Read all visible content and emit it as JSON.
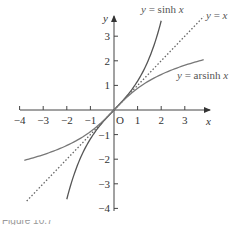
{
  "chart_data": {
    "type": "line",
    "title": "",
    "xlabel": "x",
    "ylabel": "y",
    "origin_label": "O",
    "xlim": [
      -4,
      4
    ],
    "ylim": [
      -4,
      3.8
    ],
    "grid": false,
    "legend": "inline labels",
    "x_ticks": [
      -4,
      -3,
      -2,
      -1,
      1,
      2,
      3
    ],
    "y_ticks": [
      3,
      2,
      1,
      -1,
      -2,
      -3,
      -4
    ],
    "x_tick_labels": [
      "−4",
      "−3",
      "−2",
      "−1",
      "1",
      "2",
      "3"
    ],
    "y_tick_labels": [
      "3",
      "2",
      "1",
      "−1",
      "−2",
      "−3",
      "−4"
    ],
    "series": [
      {
        "name": "y = sinh x",
        "style": "solid",
        "color": "#555555",
        "x": [
          -2.0,
          -1.5,
          -1.0,
          -0.5,
          0,
          0.5,
          1.0,
          1.5,
          2.0
        ],
        "y": [
          -3.63,
          -2.13,
          -1.18,
          -0.52,
          0,
          0.52,
          1.18,
          2.13,
          3.63
        ]
      },
      {
        "name": "y = x",
        "style": "dotted",
        "color": "#666666",
        "x": [
          -3.7,
          3.8
        ],
        "y": [
          -3.7,
          3.8
        ]
      },
      {
        "name": "y = arsinh x",
        "style": "solid",
        "color": "#777777",
        "x": [
          -3.8,
          -3,
          -2,
          -1,
          0,
          1,
          2,
          3,
          3.8
        ],
        "y": [
          -2.04,
          -1.82,
          -1.44,
          -0.88,
          0,
          0.88,
          1.44,
          1.82,
          2.04
        ]
      }
    ],
    "labels": {
      "sinh": [
        "y",
        " = sinh ",
        "x"
      ],
      "identity": [
        "y",
        " = ",
        "x"
      ],
      "arsinh": [
        "y",
        " = arsinh ",
        "x"
      ]
    }
  },
  "caption": "Figure 10.7"
}
